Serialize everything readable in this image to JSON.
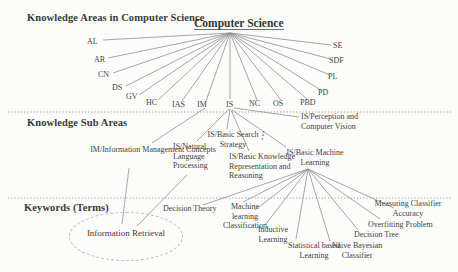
{
  "headings": {
    "areas": "Knowledge Areas in Computer Science",
    "sub_areas": "Knowledge Sub Areas",
    "keywords": "Keywords (Terms)"
  },
  "root_label": "Computer Science",
  "areas": [
    "AL",
    "AR",
    "CN",
    "DS",
    "GV",
    "HC",
    "IAS",
    "IM",
    "IS",
    "NC",
    "OS",
    "PBD",
    "PD",
    "PL",
    "SDF",
    "SE"
  ],
  "sub_areas": {
    "perception": "IS/Perception and Computer Vision",
    "im_concepts": "IM/Information Management Concepts",
    "nlp": "IS/Natural Language Processing",
    "search": "IS/Basic Search Strategy",
    "krr": "IS/Basic Knowledge Representation and Reasoning",
    "ml": "IS/Basic Machine Learning"
  },
  "keywords": {
    "information_retrieval": "Information Retrieval",
    "decision_theory": "Decision Theory",
    "ml_classification": "Machine learning Classification",
    "inductive": "Inductive Learning",
    "statistical": "Statistical based Learning",
    "naive_bayes": "Naive Bayesian Classifier",
    "decision_tree": "Decision Tree",
    "overfitting": "Overfitting Problem",
    "measuring": "Measuring Classifier Accuracy"
  },
  "ellipsis_glyph": "⋮",
  "colors": {
    "background": "#fcfcfb",
    "text": "#3d3d3d",
    "line": "#8f8f8f",
    "ellipse_border": "#bdbdbd"
  },
  "edges": [
    "Computer Science -> AL, AR, CN, DS, GV, HC, IAS, IM, IS, NC, OS, PBD, PD, PL, SDF, SE",
    "IM -> IM/Information Management Concepts",
    "IS -> IS/Perception and Computer Vision",
    "IS -> IS/Natural Language Processing",
    "IS -> IS/Basic Search Strategy",
    "IS -> IS/Basic Knowledge Representation and Reasoning",
    "IS -> IS/Basic Machine Learning",
    "IM/Information Management Concepts -> Information Retrieval",
    "IS/Natural Language Processing -> Information Retrieval",
    "IS/Basic Machine Learning -> Decision Theory",
    "IS/Basic Machine Learning -> Machine learning Classification",
    "IS/Basic Machine Learning -> Inductive Learning",
    "IS/Basic Machine Learning -> Statistical based Learning",
    "IS/Basic Machine Learning -> Naive Bayesian Classifier",
    "IS/Basic Machine Learning -> Decision Tree",
    "IS/Basic Machine Learning -> Overfitting Problem",
    "IS/Basic Machine Learning -> Measuring Classifier Accuracy"
  ]
}
